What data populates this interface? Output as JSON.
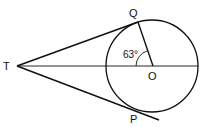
{
  "diagram": {
    "type": "geometry",
    "points": {
      "T": {
        "label": "T",
        "x": 17,
        "y": 66
      },
      "Q": {
        "label": "Q",
        "x": 138,
        "y": 22
      },
      "O": {
        "label": "O",
        "x": 152,
        "y": 66
      },
      "P": {
        "label": "P",
        "x": 138,
        "y": 110
      }
    },
    "circle": {
      "center": "O",
      "cx": 152,
      "cy": 66,
      "r": 46
    },
    "segments": [
      {
        "from": "T",
        "to": "Q",
        "kind": "tangent"
      },
      {
        "from": "T",
        "to": "P",
        "kind": "tangent (extended beyond P)"
      },
      {
        "from": "T",
        "to": "O",
        "kind": "line through centre to circle edge"
      },
      {
        "from": "O",
        "to": "Q",
        "kind": "radius"
      }
    ],
    "angle": {
      "label": "63°",
      "vertex": "O",
      "between": [
        "Q",
        "T"
      ]
    },
    "colors": {
      "stroke": "#111111",
      "background": "#ffffff"
    }
  }
}
